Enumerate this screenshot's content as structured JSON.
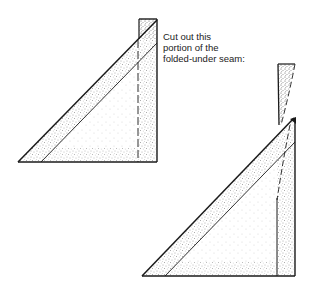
{
  "figure": {
    "caption_lines": [
      "Cut out this",
      "portion of the",
      "folded-under seam:"
    ],
    "colors": {
      "ink": "#1a1a1a",
      "background": "#ffffff",
      "stipple": "#555555"
    },
    "shapes": {
      "left_triangle": {
        "label": "folded seam triangle (before cutting)",
        "outer_diagonal_tip": [
          18,
          162
        ],
        "inner_diagonal_start": [
          41,
          162
        ],
        "top_rect": [
          139,
          19,
          157,
          19
        ],
        "bottom_right": [
          157,
          162
        ],
        "dashed_seam_x": 138
      },
      "cut_piece": {
        "label": "portion of folded-under seam removed",
        "top_left": [
          278,
          64
        ],
        "top_right": [
          295,
          64
        ],
        "tip": [
          280,
          125
        ]
      },
      "right_triangle": {
        "label": "folded seam triangle (after cutting)",
        "outer_diagonal_tip": [
          142,
          276
        ],
        "inner_diagonal_start": [
          165,
          276
        ],
        "top_corner": [
          293,
          119
        ],
        "bottom_right": [
          295,
          276
        ],
        "solid_seam_x": 277
      }
    }
  }
}
